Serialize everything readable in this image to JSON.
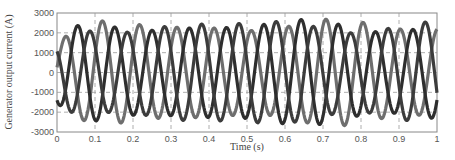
{
  "chart_data": {
    "type": "line",
    "title": "",
    "xlabel": "Time (s)",
    "ylabel": "Generator output current (A)",
    "xlim": [
      0,
      1
    ],
    "ylim": [
      -3000,
      3000
    ],
    "xticks": [
      0,
      0.1,
      0.2,
      0.3,
      0.4,
      0.5,
      0.6,
      0.7,
      0.8,
      0.9,
      1
    ],
    "xtick_labels": [
      "0",
      "0.1",
      "0.2",
      "0.3",
      "0.4",
      "0.5",
      "0.6",
      "0.7",
      "0.8",
      "0.9",
      "1"
    ],
    "yticks": [
      3000,
      2000,
      1000,
      0,
      -1000,
      -2000,
      -3000
    ],
    "ytick_labels": [
      "3000",
      "2000",
      "1000",
      "0",
      "-1000",
      "-2000",
      "-3000"
    ],
    "grid": true,
    "legend": null,
    "series": [
      {
        "name": "Phase A",
        "color": "#6e6e6e",
        "frequency_hz": 10.2,
        "amplitude": 2350,
        "phase_deg": 0
      },
      {
        "name": "Phase B",
        "color": "#2e2e2e",
        "frequency_hz": 10.2,
        "amplitude": 2350,
        "phase_deg": -120
      },
      {
        "name": "Phase C",
        "color": "#3c3c3c",
        "frequency_hz": 10.2,
        "amplitude": 2350,
        "phase_deg": 120
      }
    ]
  }
}
